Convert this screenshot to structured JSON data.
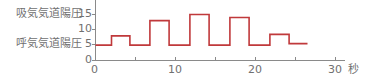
{
  "chart_data": {
    "type": "line",
    "step": true,
    "title": "",
    "xlabel": "秒",
    "ylabel": "",
    "xlim": [
      0,
      30
    ],
    "ylim": [
      0,
      18
    ],
    "x_ticks": [
      0,
      10,
      20,
      30
    ],
    "x_minor_ticks": [
      5,
      15,
      25
    ],
    "y_ticks": [
      0,
      5,
      10,
      15
    ],
    "grid": false,
    "annotations": [
      {
        "text": "吸気気道陽圧",
        "y": 15
      },
      {
        "text": "呼気気道陽圧",
        "y": 5
      }
    ],
    "series": [
      {
        "name": "airway pressure",
        "color": "#c0393b",
        "x": [
          0,
          2,
          2,
          4.3,
          4.3,
          6.8,
          6.8,
          9.2,
          9.2,
          11.8,
          11.8,
          14.2,
          14.2,
          16.8,
          16.8,
          19.2,
          19.2,
          21.8,
          21.8,
          24.2,
          24.2,
          26.5
        ],
        "y": [
          5,
          5,
          8,
          8,
          5,
          5,
          13,
          13,
          5,
          5,
          15,
          15,
          5,
          5,
          14,
          14,
          5,
          5,
          8.5,
          8.5,
          5.5,
          5.5
        ]
      }
    ]
  },
  "labels": {
    "ipap": "吸気気道陽圧",
    "epap": "呼気気道陽圧",
    "unit": "秒",
    "y15": "15",
    "y10": "10",
    "y5": "5",
    "y0": "0",
    "x0": "0",
    "x10": "10",
    "x20": "20",
    "x30": "30"
  }
}
